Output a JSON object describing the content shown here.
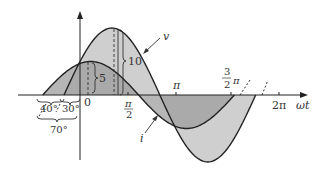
{
  "diagram": {
    "curves": {
      "v": {
        "label": "v",
        "amplitude": 10,
        "phase_deg": 30,
        "fill": "#c8c8c8"
      },
      "i": {
        "label": "i",
        "amplitude": 5,
        "phase_deg": 70,
        "fill": "#a8a8a8"
      }
    },
    "amplitude_labels": {
      "v_peak": "10",
      "i_peak": "5"
    },
    "x_axis": {
      "label": "ωt",
      "ticks": [
        {
          "label": "0"
        },
        {
          "label_num": "π",
          "label_den": "2"
        },
        {
          "label": "π"
        },
        {
          "label_num": "3",
          "label_den": "2",
          "label_suffix": "π"
        },
        {
          "label": "2π"
        }
      ]
    },
    "phase_labels": {
      "v_lead": "30°",
      "difference": "40°",
      "i_lead": "70°"
    }
  }
}
